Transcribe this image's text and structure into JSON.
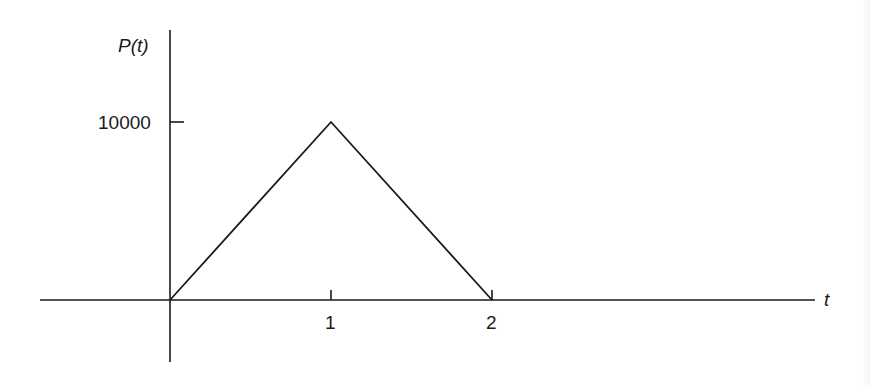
{
  "chart_data": {
    "type": "line",
    "title": "",
    "xlabel": "t",
    "ylabel": "P(t)",
    "x": [
      0,
      1,
      2
    ],
    "series": [
      {
        "name": "P(t)",
        "values": [
          0,
          10000,
          0
        ]
      }
    ],
    "x_ticks": [
      "1",
      "2"
    ],
    "y_ticks": [
      "10000"
    ],
    "xlim": [
      -0.8,
      4.0
    ],
    "ylim": [
      -3500,
      15500
    ],
    "grid": false,
    "legend": "none",
    "colors": {
      "line": "#1a1a1a",
      "axes": "#1a1a1a",
      "background": "#ffffff"
    }
  },
  "labels": {
    "y_axis": "P(t)",
    "x_axis": "t",
    "y_tick_10000": "10000",
    "x_tick_1": "1",
    "x_tick_2": "2"
  }
}
